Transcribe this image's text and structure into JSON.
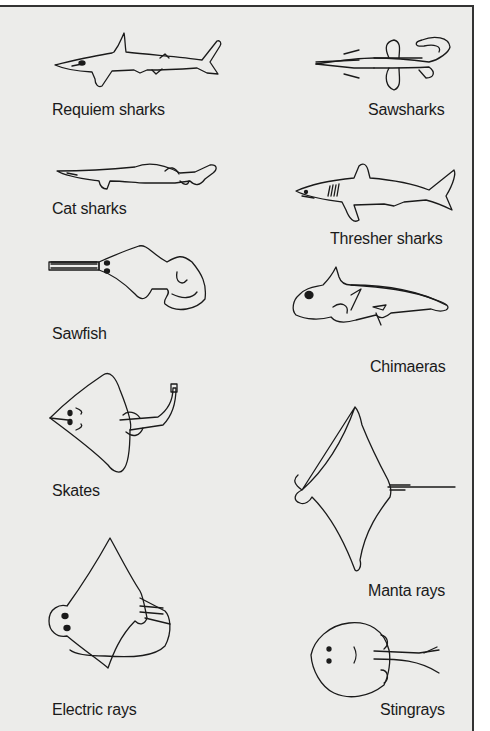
{
  "colors": {
    "background": "#ececea",
    "border": "#333333",
    "ink": "#1a1a1a"
  },
  "left_column": [
    {
      "label": "Requiem sharks",
      "icon": "requiem-shark-illustration"
    },
    {
      "label": "Cat sharks",
      "icon": "cat-shark-illustration"
    },
    {
      "label": "Sawfish",
      "icon": "sawfish-illustration"
    },
    {
      "label": "Skates",
      "icon": "skate-illustration"
    },
    {
      "label": "Electric rays",
      "icon": "electric-ray-illustration"
    }
  ],
  "right_column": [
    {
      "label": "Sawsharks",
      "icon": "sawshark-illustration"
    },
    {
      "label": "Thresher sharks",
      "icon": "thresher-shark-illustration"
    },
    {
      "label": "Chimaeras",
      "icon": "chimaera-illustration"
    },
    {
      "label": "Manta rays",
      "icon": "manta-ray-illustration"
    },
    {
      "label": "Stingrays",
      "icon": "stingray-illustration"
    }
  ]
}
